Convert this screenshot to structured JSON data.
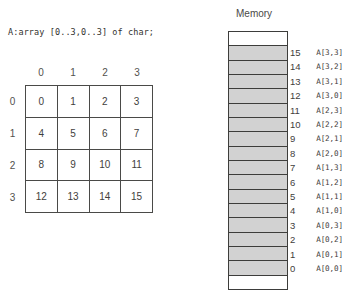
{
  "declaration": "A:array [0..3,0..3] of char;",
  "matrix": {
    "col_headers": [
      "0",
      "1",
      "2",
      "3"
    ],
    "row_headers": [
      "0",
      "1",
      "2",
      "3"
    ],
    "rows": [
      [
        "0",
        "1",
        "2",
        "3"
      ],
      [
        "4",
        "5",
        "6",
        "7"
      ],
      [
        "8",
        "9",
        "10",
        "11"
      ],
      [
        "12",
        "13",
        "14",
        "15"
      ]
    ]
  },
  "memory": {
    "title": "Memory",
    "top_pad_cell": "",
    "bottom_pad_cell": "",
    "cells": [
      {
        "index": "15",
        "name": "A[3,3]"
      },
      {
        "index": "14",
        "name": "A[3,2]"
      },
      {
        "index": "13",
        "name": "A[3,1]"
      },
      {
        "index": "12",
        "name": "A[3,0]"
      },
      {
        "index": "11",
        "name": "A[2,3]"
      },
      {
        "index": "10",
        "name": "A[2,2]"
      },
      {
        "index": "9",
        "name": "A[2,1]"
      },
      {
        "index": "8",
        "name": "A[2,0]"
      },
      {
        "index": "7",
        "name": "A[1,3]"
      },
      {
        "index": "6",
        "name": "A[1,2]"
      },
      {
        "index": "5",
        "name": "A[1,1]"
      },
      {
        "index": "4",
        "name": "A[1,0]"
      },
      {
        "index": "3",
        "name": "A[0,3]"
      },
      {
        "index": "2",
        "name": "A[0,2]"
      },
      {
        "index": "1",
        "name": "A[0,1]"
      },
      {
        "index": "0",
        "name": "A[0,0]"
      }
    ]
  },
  "colors": {
    "cell_fill": "#d2d2d2",
    "border": "#3d3d3b",
    "text": "#3f3e3c"
  }
}
